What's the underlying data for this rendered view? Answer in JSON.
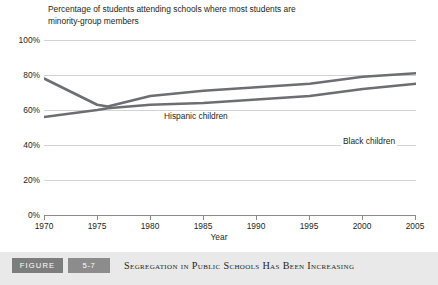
{
  "chart_title_line1": "Percentage of students attending schools where most students are",
  "chart_title_line2": "minority-group members",
  "axis": {
    "y_labels": [
      "100%",
      "80%",
      "60%",
      "40%",
      "20%",
      "0%"
    ],
    "x_labels": [
      "1970",
      "1975",
      "1980",
      "1985",
      "1990",
      "1995",
      "2000",
      "2005"
    ],
    "x_title": "Year"
  },
  "series_labels": {
    "hispanic": "Hispanic children",
    "black": "Black children"
  },
  "caption": {
    "figure_word": "FIGURE",
    "figure_number": "5-7",
    "title": "Segregation in Public Schools Has Been Increasing"
  },
  "colors": {
    "line": "#6d6e71",
    "grid": "#d3d3d3",
    "axis": "#8a8a8a",
    "caption_bar": "#e9e9e9",
    "badge": "#7d7d7d",
    "text": "#231f20"
  },
  "chart_data": {
    "type": "line",
    "title": "Percentage of students attending schools where most students are minority-group members",
    "xlabel": "Year",
    "ylabel": "",
    "xlim": [
      1970,
      2005
    ],
    "ylim": [
      0,
      100
    ],
    "yticks": [
      0,
      20,
      40,
      60,
      80,
      100
    ],
    "xticks": [
      1970,
      1975,
      1980,
      1985,
      1990,
      1995,
      2000,
      2005
    ],
    "ytick_labels": [
      "0%",
      "20%",
      "40%",
      "60%",
      "80%",
      "100%"
    ],
    "grid": true,
    "legend": "inline-labels",
    "x": [
      1970,
      1975,
      1976,
      1980,
      1985,
      1990,
      1995,
      2000,
      2005
    ],
    "series": [
      {
        "name": "Hispanic children",
        "values": [
          78,
          63,
          62,
          68,
          71,
          73,
          75,
          79,
          81
        ]
      },
      {
        "name": "Black children",
        "values": [
          56,
          60,
          61,
          63,
          64,
          66,
          68,
          72,
          75
        ]
      }
    ]
  }
}
